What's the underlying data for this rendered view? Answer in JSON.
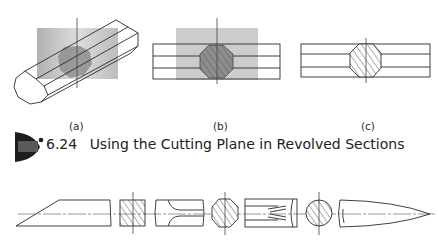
{
  "figure": {
    "number": "6.24",
    "title": "Using the Cutting Plane in Revolved Sections",
    "panels": [
      {
        "id": "a",
        "label": "(a)",
        "description": "Octagonal bar in pictorial view with transparent cutting plane through it"
      },
      {
        "id": "b",
        "label": "(b)",
        "description": "Orthographic view with cutting plane and revolved octagonal section"
      },
      {
        "id": "c",
        "label": "(c)",
        "description": "Finished view with revolved hatched octagonal section"
      }
    ],
    "bottom_row": {
      "description": "Examples of revolved sections on various shapes",
      "items": [
        "chamfered-end-bar",
        "square-section",
        "cylindrical-bar-with-flats",
        "octagonal-section",
        "bar-with-fluted-ends",
        "circular-section",
        "tapered-pointed-end"
      ]
    }
  },
  "colors": {
    "line": "#2b2b2b",
    "plane": "#b8b8b8",
    "section_fill": "#8a8a8a",
    "badge": "#1e1e1e"
  }
}
